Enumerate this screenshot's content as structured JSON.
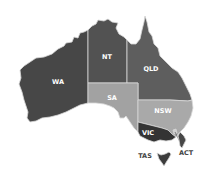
{
  "map": {
    "title": "Australia states and territories",
    "regions": [
      {
        "code": "WA",
        "label": "WA",
        "fill": "#474747"
      },
      {
        "code": "NT",
        "label": "NT",
        "fill": "#525252"
      },
      {
        "code": "QLD",
        "label": "QLD",
        "fill": "#5e5e5e"
      },
      {
        "code": "SA",
        "label": "SA",
        "fill": "#a2a2a2"
      },
      {
        "code": "NSW",
        "label": "NSW",
        "fill": "#a9a9a9"
      },
      {
        "code": "VIC",
        "label": "VIC",
        "fill": "#343434"
      },
      {
        "code": "ACT",
        "label": "ACT",
        "fill": "#d0d0d0"
      },
      {
        "code": "TAS",
        "label": "TAS",
        "fill": "#3c3c3c"
      }
    ]
  }
}
